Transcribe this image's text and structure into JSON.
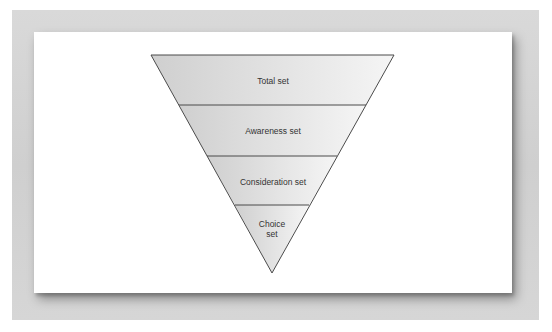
{
  "figure": {
    "type": "inverted-funnel",
    "colors": {
      "outer_panel": "#d3d3d3",
      "card": "#ffffff",
      "fill_left": "#d2d2d2",
      "fill_right": "#f3f3f3",
      "stroke": "#555555",
      "label": "#333333"
    },
    "levels": [
      {
        "label": "Total set"
      },
      {
        "label": "Awareness set"
      },
      {
        "label": "Consideration set"
      },
      {
        "label": "Choice set",
        "lines": [
          "Choice",
          "set"
        ]
      }
    ]
  },
  "caption": {
    "text": ""
  }
}
